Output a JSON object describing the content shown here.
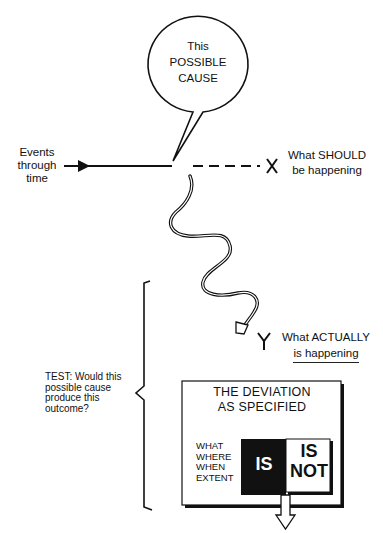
{
  "bubble": {
    "line1": "This",
    "line2": "POSSIBLE",
    "line3": "CAUSE"
  },
  "timeline": {
    "label_line1": "Events",
    "label_line2": "through",
    "label_line3": "time",
    "should_marker": "X",
    "should_line1": "What SHOULD",
    "should_line2": "be happening",
    "actual_marker": "Y",
    "actual_line1": "What ACTUALLY",
    "actual_line2": "is happening"
  },
  "test": {
    "line1": "TEST: Would this",
    "line2": "possible cause",
    "line3": "produce this",
    "line4": "outcome?"
  },
  "deviation": {
    "title_line1": "THE DEVIATION",
    "title_line2": "AS SPECIFIED",
    "dimensions": [
      "WHAT",
      "WHERE",
      "WHEN",
      "EXTENT"
    ],
    "is_label": "IS",
    "isnot_line1": "IS",
    "isnot_line2": "NOT"
  },
  "colors": {
    "ink": "#111111",
    "background": "#ffffff"
  }
}
